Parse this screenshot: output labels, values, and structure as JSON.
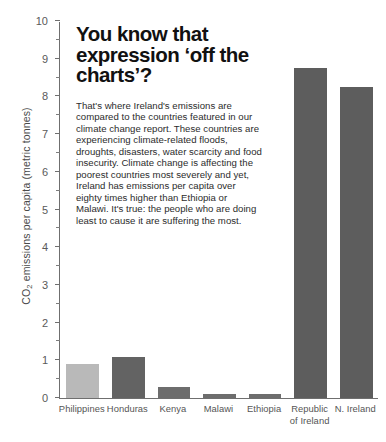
{
  "chart_data": {
    "type": "bar",
    "title": "",
    "xlabel": "",
    "ylabel": "CO₂ emissions per capita (metric tonnes)",
    "ylabel_main": "CO",
    "ylabel_sub": "2",
    "ylabel_rest": " emissions per capita (metric tonnes)",
    "categories": [
      "Philippines",
      "Honduras",
      "Kenya",
      "Malawi",
      "Ethiopia",
      "Republic of Ireland",
      "N. Ireland"
    ],
    "category_lines": [
      [
        "Philippines"
      ],
      [
        "Honduras"
      ],
      [
        "Kenya"
      ],
      [
        "Malawi"
      ],
      [
        "Ethiopia"
      ],
      [
        "Republic",
        "of Ireland"
      ],
      [
        "N. Ireland"
      ]
    ],
    "values": [
      0.9,
      1.1,
      0.3,
      0.1,
      0.1,
      8.75,
      8.25
    ],
    "bar_colors": [
      "#b9b9b9",
      "#636363",
      "#6d6d6d",
      "#6d6d6d",
      "#6d6d6d",
      "#5d5d5d",
      "#5d5d5d"
    ],
    "ylim": [
      0,
      10
    ],
    "ytick_values": [
      0,
      1,
      2,
      3,
      4,
      5,
      6,
      7,
      8,
      9,
      10
    ],
    "ytick_labels": [
      "0",
      "1",
      "2",
      "3",
      "4",
      "5",
      "6",
      "7",
      "8",
      "9",
      "10"
    ],
    "yminor_values": [
      0.5,
      1.5,
      2.5,
      3.5,
      4.5,
      5.5,
      6.5,
      7.5,
      8.5,
      9.5
    ],
    "grid": false,
    "legend": "none"
  },
  "overlay": {
    "headline": "You know that expression ‘off the charts’?",
    "paragraphs": [
      "That's where Ireland's emissions are compared to the countries featured in our climate change report. These countries are experiencing climate-related floods, droughts, disasters, water scarcity and food insecurity. Climate change is affecting the poorest countries most severely and yet, Ireland has emissions per capita over eighty times higher than Ethiopia or Malawi. It's true: the people who are doing least to cause it are suffering the most."
    ]
  },
  "colors": {
    "axis": "#6f6f6f",
    "tick_text": "#5a5a5a",
    "body_text": "#2c2c2c",
    "headline_text": "#111111",
    "background": "#ffffff"
  }
}
